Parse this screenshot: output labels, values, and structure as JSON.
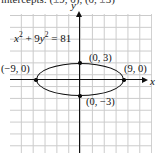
{
  "figure": {
    "caption_clipped": "intercepts: (±9, 0), (0, ±3)",
    "equation": {
      "lhs_x": "x",
      "x_exp": "2",
      "plus": " + 9",
      "lhs_y": "y",
      "y_exp": "2",
      "rhs": " = 81",
      "full": "x² + 9y² = 81"
    },
    "axes": {
      "x_label": "x",
      "y_label": "y",
      "x_axis_name": "x-axis",
      "y_axis_name": "y-axis",
      "grid": true,
      "grid_color": "#c9c9c9",
      "axis_color": "#111111"
    },
    "curve": {
      "type": "ellipse",
      "color": "#0d0d0d",
      "semi_major_a": 9,
      "semi_minor_b": 3,
      "center": "(0, 0)"
    },
    "points": [
      {
        "name": "left-vertex",
        "label": "(−9, 0)",
        "x": -9,
        "y": 0
      },
      {
        "name": "right-vertex",
        "label": "(9, 0)",
        "x": 9,
        "y": 0
      },
      {
        "name": "top-vertex",
        "label": "(0, 3)",
        "x": 0,
        "y": 3
      },
      {
        "name": "bottom-vertex",
        "label": "(0, −3)",
        "x": 0,
        "y": -3
      }
    ]
  },
  "chart_data": {
    "type": "line",
    "title": "",
    "xlabel": "x",
    "ylabel": "y",
    "xlim": [
      -12,
      12
    ],
    "ylim": [
      -9,
      9
    ],
    "grid": true,
    "annotations": [
      "x² + 9y² = 81",
      "(−9, 0)",
      "(9, 0)",
      "(0, 3)",
      "(0, −3)"
    ],
    "series": [
      {
        "name": "x^2 + 9y^2 = 81",
        "shape": "ellipse",
        "center": [
          0,
          0
        ],
        "a": 9,
        "b": 3,
        "x_intercepts": [
          -9,
          9
        ],
        "y_intercepts": [
          -3,
          3
        ]
      }
    ]
  }
}
